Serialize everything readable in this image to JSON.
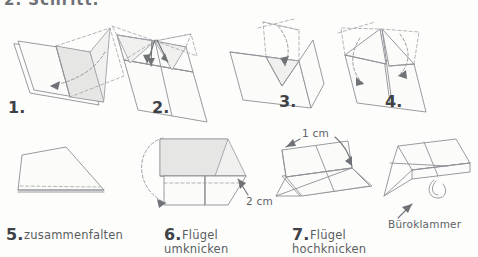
{
  "document": {
    "title_fragment": "2. Schritt:",
    "language": "de",
    "subject": "Papierflieger Faltanleitung",
    "background_color": "#fdfdfc",
    "ink_color": "#8d9094",
    "text_color": "#55585c"
  },
  "steps": [
    {
      "id": 1,
      "number": "1.",
      "caption": ""
    },
    {
      "id": 2,
      "number": "2.",
      "caption": ""
    },
    {
      "id": 3,
      "number": "3.",
      "caption": ""
    },
    {
      "id": 4,
      "number": "4.",
      "caption": ""
    },
    {
      "id": 5,
      "number": "5.",
      "caption": "zusammenfalten"
    },
    {
      "id": 6,
      "number": "6.",
      "caption_line1": "Flügel",
      "caption_line2": "umknicken"
    },
    {
      "id": 7,
      "number": "7.",
      "caption_line1": "Flügel",
      "caption_line2": "hochknicken"
    }
  ],
  "annotations": {
    "measure_2cm": "2 cm",
    "measure_1cm": "1 cm",
    "paperclip": "Büroklammer"
  }
}
